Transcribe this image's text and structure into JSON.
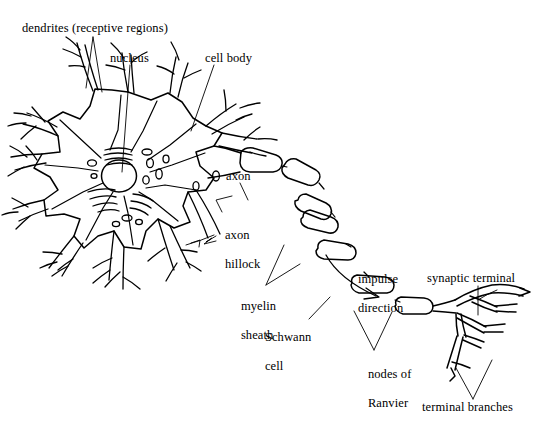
{
  "figure": {
    "width": 542,
    "height": 437,
    "background_color": "#ffffff",
    "ink_color": "#000000"
  },
  "labels": {
    "dendrites": "dendrites (receptive regions)",
    "nucleus": "nucleus",
    "cell_body": "cell body",
    "axon": "axon",
    "axon_hillock_line1": "axon",
    "axon_hillock_line2": "hillock",
    "myelin_line1": "myelin",
    "myelin_line2": "sheath",
    "schwann_line1": "Schwann",
    "schwann_line2": "cell",
    "impulse_line1": "impulse",
    "impulse_line2": "direction",
    "nodes_line1": "nodes of",
    "nodes_line2": "Ranvier",
    "synaptic_terminal": "synaptic terminal",
    "terminal_branches": "terminal branches"
  },
  "anatomy": {
    "parts": [
      "dendrites",
      "nucleus",
      "cell body",
      "axon",
      "axon hillock",
      "myelin sheath",
      "Schwann cell",
      "nodes of Ranvier",
      "synaptic terminal",
      "terminal branches"
    ],
    "myelin_segment_count": 7,
    "node_count": 6,
    "impulse_direction": "away from cell body toward terminal branches"
  }
}
